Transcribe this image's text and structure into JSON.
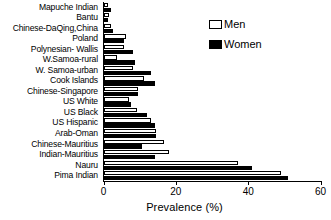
{
  "chart_data": {
    "type": "bar",
    "orientation": "horizontal",
    "title": "",
    "xlabel": "Prevalence (%)",
    "ylabel": "",
    "xlim": [
      0,
      60
    ],
    "xticks": [
      0,
      20,
      40,
      60
    ],
    "xtick_labels": [
      "0",
      "20",
      "40",
      "60"
    ],
    "grid": false,
    "legend_position": "upper right",
    "categories": [
      "Mapuche Indian",
      "Bantu",
      "Chinese-DaQing,China",
      "Poland",
      "Polynesian- Wallis",
      "W.Samoa-rural",
      "W. Samoa-urban",
      "Cook Islands",
      "Chinese-Singapore",
      "US White",
      "US Black",
      "US Hispanic",
      "Arab-Oman",
      "Chinese-Mauritius",
      "Indian-Mauritius",
      "Nauru",
      "Pima Indian"
    ],
    "series": [
      {
        "name": "Men",
        "color": "#ffffff",
        "edgecolor": "#000000",
        "values": [
          1,
          1.5,
          2,
          6,
          5.5,
          3.5,
          8,
          11,
          9.5,
          7,
          9,
          13,
          14.5,
          16.5,
          18,
          37,
          49
        ]
      },
      {
        "name": "Women",
        "color": "#000000",
        "edgecolor": "#000000",
        "values": [
          2,
          1,
          2.5,
          5.5,
          8,
          8.5,
          13,
          14,
          9.5,
          7.5,
          12,
          14,
          14.5,
          10.5,
          14,
          41,
          51
        ]
      }
    ]
  },
  "legend": {
    "items": [
      {
        "label": "Men"
      },
      {
        "label": "Women"
      }
    ]
  }
}
